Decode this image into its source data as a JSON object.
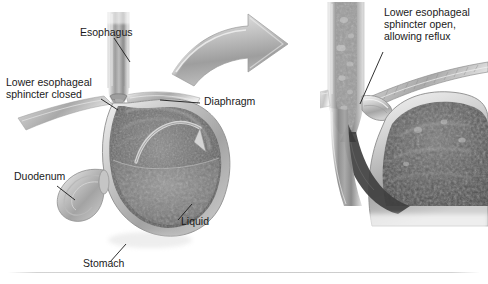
{
  "figure": {
    "style": "grayscale medical illustration",
    "background_color": "#ffffff"
  },
  "panels": {
    "main": {
      "name": "main-anatomy-panel",
      "description": "Sagittal cross-section of the stomach, esophagus, diaphragm and duodenum with the lower esophageal sphincter closed and liquid retained in the stomach."
    },
    "inset": {
      "name": "inset-detail-panel",
      "description": "Magnified detail of the gastroesophageal junction with the lower esophageal sphincter open, allowing gastric contents to reflux upward into the esophagus."
    }
  },
  "labels": {
    "esophagus": "Esophagus",
    "sphincter_closed_line1": "Lower esophageal",
    "sphincter_closed_line2": "sphincter closed",
    "diaphragm": "Diaphragm",
    "duodenum": "Duodenum",
    "liquid": "Liquid",
    "stomach": "Stomach",
    "sphincter_open_line1": "Lower esophageal",
    "sphincter_open_line2": "sphincter open,",
    "sphincter_open_line3": "allowing reflux"
  },
  "graphics": {
    "magnify_arrow": "curved-gray-arrow-pointing-right",
    "stomach_flow_arrow": "curved-arrow-inside-stomach",
    "reflux_arrow": "dark-reflux-arrow-inset"
  },
  "colors": {
    "text": "#1a1a1a",
    "leader_line": "#1a1a1a",
    "arrow_light": "#d8d8d8",
    "arrow_mid": "#a8a8a8",
    "arrow_dark": "#8a8a8a",
    "tissue_light": "#e6e6e6",
    "tissue_mid": "#b0b0b0",
    "tissue_dark": "#6f6f6f",
    "lumen_dark": "#4a4a4a",
    "rule": "#c9c9c9"
  }
}
